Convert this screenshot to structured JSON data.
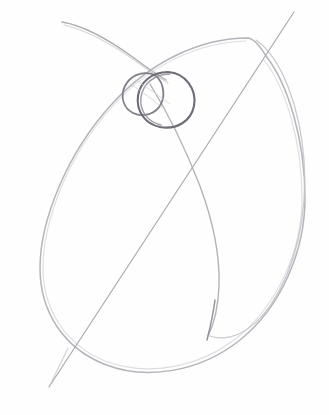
{
  "artwork": {
    "title": "Pencil construction sketch",
    "medium": "graphite pencil on paper",
    "subject": "gesture / construction guide lines",
    "canvas": {
      "width": 329,
      "height": 415,
      "background_color": "#fefefe",
      "paper_tone": "#ffffff"
    },
    "palette": {
      "graphite_light": "#c9c9cd",
      "graphite_mid": "#a9a9af",
      "graphite_dark": "#7b7b83",
      "graphite_darkest": "#5e5e66"
    },
    "strokes": [
      {
        "name": "sweep-curve-top-left",
        "description": "Long thin curve sweeping from upper-left down toward the circles",
        "color": "#a9a9af",
        "width": 1.4,
        "opacity": 0.95,
        "path": "M 62 22 C 86 26 112 42 134 58 C 146 67 156 74 166 80"
      },
      {
        "name": "sweep-curve-top-left-shadow",
        "description": "Faint double-stroke echo of the upper-left sweep",
        "color": "#cbcbd0",
        "width": 1.2,
        "opacity": 0.8,
        "path": "M 64 25 C 90 31 116 47 137 62 C 149 71 158 77 168 83"
      },
      {
        "name": "main-ellipse-body",
        "description": "Large tilted egg/ellipse forming the main body mass",
        "color": "#b4b4ba",
        "width": 1.5,
        "opacity": 1,
        "path": "M 248 38 C 200 38 150 62 112 104 C 66 154 40 222 40 268 C 40 312 64 348 104 364 C 146 381 200 372 240 340 C 282 306 305 250 305 198 C 305 140 288 84 266 56 C 260 46 254 39 248 38 Z"
      },
      {
        "name": "main-ellipse-body-echo",
        "description": "Faint secondary contour alongside the main ellipse",
        "color": "#d2d2d7",
        "width": 1.1,
        "opacity": 0.75,
        "path": "M 246 41 C 198 42 148 66 111 108 C 66 158 43 224 43 268 C 43 310 66 345 105 361 C 147 377 199 368 238 337 C 279 303 302 249 302 198 C 302 142 286 88 264 60"
      },
      {
        "name": "right-outer-arc",
        "description": "Outer arc on the right side rising from the top toward the lower right",
        "color": "#c3c3c9",
        "width": 1.3,
        "opacity": 0.9,
        "path": "M 256 40 C 282 58 300 108 304 160 C 308 214 296 268 270 306 C 250 334 228 342 210 336"
      },
      {
        "name": "inner-sweep-curve",
        "description": "Inner construction curve from the circles sweeping down and right to the lower right convergence",
        "color": "#aeaeb5",
        "width": 1.4,
        "opacity": 0.95,
        "path": "M 150 84 C 166 110 186 150 200 186 C 214 224 220 258 219 286 C 218 312 213 326 208 336"
      },
      {
        "name": "inner-sweep-curve-tail",
        "description": "Short darker tail where the inner curve meets the lower contour",
        "color": "#8f8f97",
        "width": 1.5,
        "opacity": 0.95,
        "path": "M 215 300 C 213 316 210 328 207 340"
      },
      {
        "name": "diagonal-axis-line",
        "description": "Long straight diagonal guide line from upper right to lower left",
        "color": "#a5a5ac",
        "width": 1.2,
        "opacity": 0.95,
        "path": "M 294 12 L 49 387"
      },
      {
        "name": "circle-left-small",
        "description": "Smaller tilted oval on the left of the overlapping pair",
        "color": "#7f7f88",
        "width": 1.8,
        "opacity": 1,
        "path": "M 152 74 C 141 71 130 76 125 86 C 120 96 123 108 133 113 C 143 118 156 114 161 104 C 166 94 163 78 152 74 Z"
      },
      {
        "name": "circle-right-large",
        "description": "Larger circle on the right of the overlapping pair, drawn more heavily",
        "color": "#6d6d76",
        "width": 2.1,
        "opacity": 1,
        "path": "M 168 72 C 152 72 140 82 138 96 C 136 111 145 124 160 127 C 177 130 191 121 194 106 C 197 90 186 73 168 72 Z"
      },
      {
        "name": "circle-right-large-echo",
        "description": "Overlapping re-drawn edge on the large circle",
        "color": "#8c8c95",
        "width": 1.4,
        "opacity": 0.85,
        "path": "M 170 74 C 154 74 143 84 141 97 C 139 111 148 122 161 125"
      },
      {
        "name": "circle-overlap-hatch",
        "description": "Faint interior hatching in the overlap of the two circles",
        "color": "#cdcdd2",
        "width": 0.9,
        "opacity": 0.8,
        "path": "M 131 84 C 142 92 152 99 163 108 M 136 80 C 148 88 159 96 170 104"
      },
      {
        "name": "lower-left-tail",
        "description": "Light tail of the diagonal extending past the lower contour",
        "color": "#c8c8ce",
        "width": 1.1,
        "opacity": 0.85,
        "path": "M 68 348 L 50 385"
      }
    ],
    "annotations": {
      "circle_count": 2,
      "stroke_count": 13,
      "has_text": false,
      "has_color": false
    }
  }
}
